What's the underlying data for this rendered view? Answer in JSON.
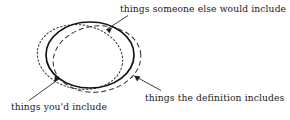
{
  "figure": {
    "background_color": "#ffffff",
    "ink_color": "#1a1a1a",
    "labels": {
      "someone_else": "things someone else would include",
      "definition": "things the definition includes",
      "youd_include": "things you'd include"
    },
    "curves": [
      {
        "name": "things-the-definition-includes",
        "style": "solid",
        "stroke_width": 1.6,
        "center": [
          90,
          55
        ],
        "radius_x": 44,
        "radius_y": 33,
        "rotation": 0
      },
      {
        "name": "things-someone-else-would-include",
        "style": "long-dashed",
        "stroke_width": 1.0,
        "dash": "5 3",
        "center": [
          97,
          59
        ],
        "radius_x": 44,
        "radius_y": 33,
        "rotation": -8
      },
      {
        "name": "things-youd-include",
        "style": "dotted",
        "stroke_width": 1.0,
        "dash": "1.6 2.2",
        "center": [
          80,
          57
        ],
        "radius_x": 43,
        "radius_y": 32,
        "rotation": 10
      }
    ],
    "leader_lines": [
      {
        "name": "leader-someone-else",
        "from": [
          128,
          16
        ],
        "to": [
          106,
          30
        ],
        "arrow_at": "to"
      },
      {
        "name": "leader-definition",
        "from": [
          160,
          91
        ],
        "to": [
          134,
          76
        ],
        "arrow_at": "to"
      },
      {
        "name": "leader-youd-include",
        "from": [
          30,
          101
        ],
        "to": [
          59,
          79
        ],
        "arrow_at": "to"
      }
    ]
  }
}
